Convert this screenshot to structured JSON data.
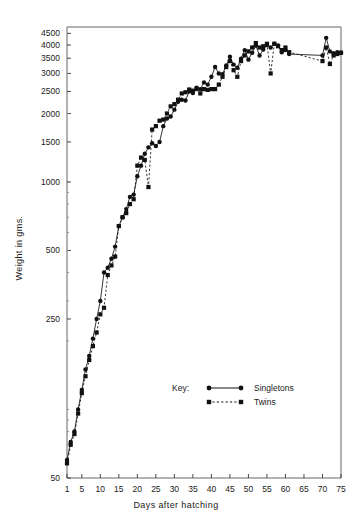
{
  "chart_data": {
    "type": "line",
    "title": "",
    "xlabel": "Days  after  hatching",
    "ylabel": "Weight  in  gms.",
    "yscale": "log",
    "ylim": [
      50,
      4800
    ],
    "xlim": [
      1,
      75
    ],
    "grid": false,
    "legend_position": "inside-lower-right",
    "legend_title": "Key:",
    "yticks": [
      50,
      250,
      500,
      1000,
      1500,
      2000,
      2500,
      3000,
      3500,
      4000,
      4500
    ],
    "ytick_labels": [
      "50",
      "250",
      "500",
      "1000",
      "1500",
      "2000",
      "2500",
      "3000",
      "3500",
      "4000",
      "4500"
    ],
    "xticks": [
      1,
      5,
      10,
      15,
      20,
      25,
      30,
      35,
      40,
      45,
      50,
      55,
      60,
      65,
      70,
      75
    ],
    "xtick_labels": [
      "1",
      "5",
      "10",
      "15",
      "20",
      "25",
      "30",
      "35",
      "40",
      "45",
      "50",
      "55",
      "60",
      "65",
      "70",
      "75"
    ],
    "series": [
      {
        "name": "Singletons",
        "marker": "circle",
        "linestyle": "solid",
        "color": "#111111",
        "points": [
          [
            1,
            60
          ],
          [
            2,
            72
          ],
          [
            3,
            80
          ],
          [
            4,
            100
          ],
          [
            5,
            122
          ],
          [
            6,
            150
          ],
          [
            7,
            172
          ],
          [
            8,
            205
          ],
          [
            9,
            250
          ],
          [
            10,
            300
          ],
          [
            11,
            400
          ],
          [
            12,
            420
          ],
          [
            13,
            460
          ],
          [
            14,
            520
          ],
          [
            15,
            640
          ],
          [
            16,
            700
          ],
          [
            17,
            760
          ],
          [
            18,
            860
          ],
          [
            19,
            880
          ],
          [
            20,
            1060
          ],
          [
            21,
            1180
          ],
          [
            22,
            1330
          ],
          [
            23,
            1420
          ],
          [
            24,
            1480
          ],
          [
            25,
            1440
          ],
          [
            26,
            1500
          ],
          [
            27,
            1760
          ],
          [
            28,
            1900
          ],
          [
            29,
            1940
          ],
          [
            30,
            2080
          ],
          [
            31,
            2250
          ],
          [
            32,
            2300
          ],
          [
            33,
            2280
          ],
          [
            34,
            2500
          ],
          [
            35,
            2460
          ],
          [
            36,
            2600
          ],
          [
            37,
            2560
          ],
          [
            38,
            2740
          ],
          [
            39,
            2680
          ],
          [
            40,
            2900
          ],
          [
            41,
            3200
          ],
          [
            42,
            3000
          ],
          [
            43,
            2980
          ],
          [
            44,
            3250
          ],
          [
            45,
            3550
          ],
          [
            46,
            3280
          ],
          [
            47,
            3180
          ],
          [
            48,
            3480
          ],
          [
            49,
            3800
          ],
          [
            50,
            3450
          ],
          [
            51,
            3700
          ],
          [
            52,
            3980
          ],
          [
            53,
            3600
          ],
          [
            54,
            3820
          ],
          [
            55,
            4000
          ],
          [
            56,
            3900
          ],
          [
            57,
            4050
          ],
          [
            58,
            3980
          ],
          [
            59,
            3720
          ],
          [
            60,
            3800
          ],
          [
            61,
            3650
          ],
          [
            70,
            3600
          ],
          [
            71,
            4300
          ],
          [
            72,
            3750
          ],
          [
            73,
            3680
          ],
          [
            74,
            3720
          ],
          [
            75,
            3700
          ]
        ]
      },
      {
        "name": "Twins",
        "marker": "square",
        "linestyle": "dashed",
        "color": "#111111",
        "points": [
          [
            1,
            58
          ],
          [
            2,
            70
          ],
          [
            3,
            78
          ],
          [
            4,
            96
          ],
          [
            5,
            118
          ],
          [
            6,
            140
          ],
          [
            7,
            165
          ],
          [
            8,
            190
          ],
          [
            9,
            218
          ],
          [
            10,
            262
          ],
          [
            11,
            280
          ],
          [
            12,
            390
          ],
          [
            13,
            430
          ],
          [
            14,
            470
          ],
          [
            15,
            640
          ],
          [
            16,
            700
          ],
          [
            17,
            730
          ],
          [
            18,
            800
          ],
          [
            19,
            840
          ],
          [
            20,
            1180
          ],
          [
            21,
            1280
          ],
          [
            22,
            1250
          ],
          [
            23,
            950
          ],
          [
            24,
            1700
          ],
          [
            25,
            1760
          ],
          [
            26,
            1860
          ],
          [
            27,
            1880
          ],
          [
            28,
            2000
          ],
          [
            29,
            2150
          ],
          [
            30,
            2200
          ],
          [
            31,
            2300
          ],
          [
            32,
            2450
          ],
          [
            33,
            2480
          ],
          [
            34,
            2550
          ],
          [
            35,
            2520
          ],
          [
            36,
            2560
          ],
          [
            37,
            2450
          ],
          [
            38,
            2560
          ],
          [
            39,
            2540
          ],
          [
            40,
            2560
          ],
          [
            41,
            2560
          ],
          [
            42,
            2680
          ],
          [
            43,
            2900
          ],
          [
            44,
            3200
          ],
          [
            45,
            3400
          ],
          [
            46,
            3100
          ],
          [
            47,
            2900
          ],
          [
            48,
            3400
          ],
          [
            49,
            3600
          ],
          [
            50,
            3750
          ],
          [
            51,
            3900
          ],
          [
            52,
            4080
          ],
          [
            53,
            3900
          ],
          [
            54,
            3950
          ],
          [
            55,
            4050
          ],
          [
            56,
            3000
          ],
          [
            57,
            4050
          ],
          [
            58,
            3950
          ],
          [
            59,
            3800
          ],
          [
            60,
            3900
          ],
          [
            61,
            3720
          ],
          [
            70,
            3400
          ],
          [
            71,
            3900
          ],
          [
            72,
            3300
          ],
          [
            73,
            3600
          ],
          [
            74,
            3650
          ],
          [
            75,
            3700
          ]
        ]
      }
    ]
  },
  "legend": {
    "key_word": "Key:",
    "entries": [
      {
        "label": "Singletons",
        "marker": "circle",
        "linestyle": "solid"
      },
      {
        "label": "Twins",
        "marker": "square",
        "linestyle": "dashed"
      }
    ]
  }
}
